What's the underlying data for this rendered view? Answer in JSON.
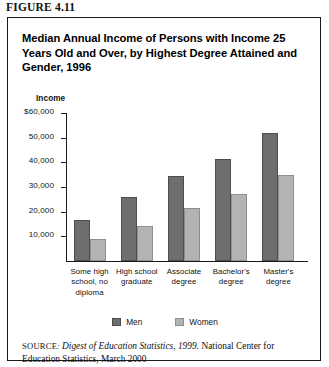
{
  "figure": {
    "number_label": "FIGURE 4.11",
    "title": "Median Annual Income of Persons with Income 25 Years Old and Over, by Highest Degree Attained and Gender, 1996"
  },
  "source": {
    "kicker": "SOURCE:",
    "italic_part": "Digest of Education Statistics, 1999.",
    "rest": " National Center for Education Statistics, March 2000"
  },
  "colors": {
    "men": "#6e6e6e",
    "women": "#b3b3b3",
    "axis": "#1a1a1a",
    "text": "#111111",
    "background": "#ffffff"
  },
  "chart_data": {
    "type": "bar",
    "title": "Median Annual Income of Persons with Income 25 Years Old and Over, by Highest Degree Attained and Gender, 1996",
    "xlabel": "",
    "ylabel": "Income",
    "ylim": [
      0,
      60000
    ],
    "grid": false,
    "legend_position": "bottom",
    "ytick_labels": [
      "$60,000",
      "50,000",
      "40,000",
      "30,000",
      "20,000",
      "10,000"
    ],
    "ytick_values": [
      60000,
      50000,
      40000,
      30000,
      20000,
      10000
    ],
    "categories": [
      "Some high school, no diploma",
      "High school graduate",
      "Associate degree",
      "Bachelor's degree",
      "Master's degree"
    ],
    "category_lines": [
      [
        "Some high",
        "school, no",
        "diploma"
      ],
      [
        "High school",
        "graduate"
      ],
      [
        "Associate",
        "degree"
      ],
      [
        "Bachelor's",
        "degree"
      ],
      [
        "Master's",
        "degree"
      ]
    ],
    "series": [
      {
        "name": "Men",
        "color": "#6e6e6e",
        "values": [
          16500,
          26000,
          34500,
          41500,
          52000
        ]
      },
      {
        "name": "Women",
        "color": "#b3b3b3",
        "values": [
          9000,
          14000,
          21500,
          27000,
          35000
        ]
      }
    ]
  }
}
